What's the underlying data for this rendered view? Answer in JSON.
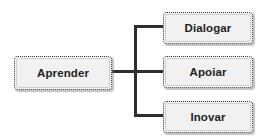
{
  "diagram": {
    "type": "org-chart",
    "background_color": "#ffffff",
    "node_fill_color": "#f1f1f1",
    "node_border_color": "#3a3a3a",
    "connector_color": "#2e2e2e",
    "text_color": "#1f1f1f",
    "root": {
      "label": "Aprender"
    },
    "children": [
      {
        "label": "Dialogar"
      },
      {
        "label": "Apoiar"
      },
      {
        "label": "Inovar"
      }
    ]
  }
}
